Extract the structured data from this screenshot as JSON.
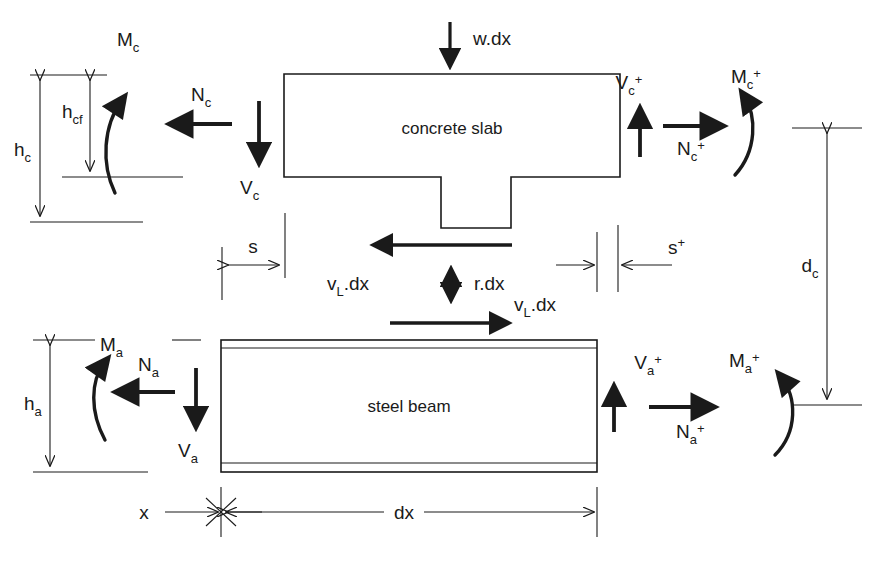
{
  "diagram": {
    "background_color": "#ffffff",
    "line_color": "#1a1a1a",
    "width": 880,
    "height": 567
  },
  "bodies": {
    "slab_label": "concrete slab",
    "beam_label": "steel beam"
  },
  "loads": {
    "w_dx": "w.dx"
  },
  "slab_forces": {
    "moment_left": "M",
    "moment_left_sub": "c",
    "normal_left": "N",
    "normal_left_sub": "c",
    "shear_left": "V",
    "shear_left_sub": "c",
    "shear_right": "V",
    "shear_right_sub": "c",
    "shear_right_sup": "+",
    "normal_right": "N",
    "normal_right_sub": "c",
    "normal_right_sup": "+",
    "moment_right": "M",
    "moment_right_sub": "c",
    "moment_right_sup": "+"
  },
  "beam_forces": {
    "moment_left": "M",
    "moment_left_sub": "a",
    "normal_left": "N",
    "normal_left_sub": "a",
    "shear_left": "V",
    "shear_left_sub": "a",
    "shear_right": "V",
    "shear_right_sub": "a",
    "shear_right_sup": "+",
    "normal_right": "N",
    "normal_right_sub": "a",
    "normal_right_sup": "+",
    "moment_right": "M",
    "moment_right_sub": "a",
    "moment_right_sup": "+"
  },
  "interface_forces": {
    "shear_flow_top": "v",
    "shear_flow_top_sub": "L",
    "shear_flow_top_tail": ".dx",
    "uplift": "r.dx",
    "shear_flow_bottom": "v",
    "shear_flow_bottom_sub": "L",
    "shear_flow_bottom_tail": ".dx"
  },
  "dimensions": {
    "h_c": "h",
    "h_c_sub": "c",
    "h_cf": "h",
    "h_cf_sub": "cf",
    "h_a": "h",
    "h_a_sub": "a",
    "d_c": "d",
    "d_c_sub": "c",
    "s": "s",
    "s_plus": "s",
    "s_plus_sup": "+",
    "x": "x",
    "dx": "dx"
  }
}
